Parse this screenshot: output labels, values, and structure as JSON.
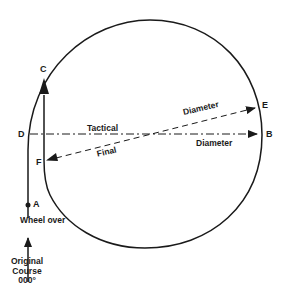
{
  "diagram": {
    "type": "ship-turning-circle",
    "points": {
      "A": "A",
      "B": "B",
      "C": "C",
      "D": "D",
      "E": "E",
      "F": "F"
    },
    "labels": {
      "wheel_over": "Wheel over",
      "tactical": "Tactical",
      "tactical_diameter": "Diameter",
      "final": "Final",
      "final_diameter": "Diameter",
      "original_course_line1": "Original",
      "original_course_line2": "Course",
      "original_course_heading": "000°"
    },
    "colors": {
      "line": "#1a1a1a",
      "background": "#ffffff"
    }
  }
}
